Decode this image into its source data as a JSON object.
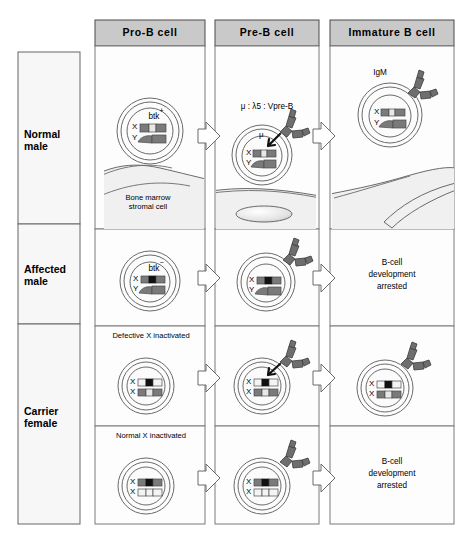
{
  "figure": {
    "background": "#ffffff",
    "header_fill": "#c9c9c9",
    "panel_fill": "#fdfdfd",
    "stroke": "#555555",
    "stromal_fill": "#f0f0f0",
    "receptor_fill": "#6e6e6e",
    "chr_gray": "#7a7a7a",
    "chr_light": "#e8e8e8",
    "chr_black": "#111111"
  },
  "columns": [
    {
      "id": "pro-b",
      "label": "Pro-B cell"
    },
    {
      "id": "pre-b",
      "label": "Pre-B cell"
    },
    {
      "id": "immature",
      "label": "Immature B cell"
    }
  ],
  "rows": [
    {
      "id": "normal-male",
      "label_line1": "Normal",
      "label_line2": "male"
    },
    {
      "id": "affected-male",
      "label_line1": "Affected",
      "label_line2": "male"
    },
    {
      "id": "carrier-female",
      "label_line1": "Carrier",
      "label_line2": "female"
    }
  ],
  "annotations": {
    "btk_positive": "btk",
    "btk_positive_sign": "+",
    "btk_negative": "btk",
    "btk_negative_sign": "−",
    "pre_b_receptor": "μ : λ5 : Vpre-B",
    "mu_chain": "μ",
    "igm": "IgM",
    "stromal_line1": "Bone  marrow",
    "stromal_line2": "stromal  cell",
    "defective_x_inactivated": "Defective  X  inactivated",
    "normal_x_inactivated": "Normal  X  inactivated",
    "arrested_line1": "B-cell",
    "arrested_line2": "development",
    "arrested_line3": "arrested"
  },
  "chromosome_labels": {
    "x": "X",
    "y": "Y"
  },
  "cells": [
    {
      "row": "normal-male",
      "column": "pro-b",
      "karyotype": "XY",
      "btk_state": "positive",
      "label": "btk",
      "has_receptor": false,
      "has_igm": false
    },
    {
      "row": "normal-male",
      "column": "pre-b",
      "karyotype": "XY",
      "btk_state": "positive",
      "label": "μ : λ5 : Vpre-B",
      "has_receptor": true,
      "has_igm": false
    },
    {
      "row": "normal-male",
      "column": "immature",
      "karyotype": "XY",
      "btk_state": "positive",
      "label": "IgM",
      "has_receptor": true,
      "has_igm": true
    },
    {
      "row": "affected-male",
      "column": "pro-b",
      "karyotype": "XY",
      "btk_state": "negative",
      "label": "btk",
      "has_receptor": false,
      "has_igm": false
    },
    {
      "row": "affected-male",
      "column": "pre-b",
      "karyotype": "XY",
      "btk_state": "negative",
      "label": "",
      "has_receptor": true,
      "has_igm": false
    },
    {
      "row": "affected-male",
      "column": "immature",
      "karyotype": "",
      "btk_state": "arrested",
      "label": "B-cell development arrested",
      "has_receptor": false,
      "has_igm": false
    },
    {
      "row": "carrier-female-top",
      "column": "pro-b",
      "karyotype": "XX",
      "btk_state": "defective-x-inactivated",
      "label": "Defective  X  inactivated",
      "has_receptor": false,
      "has_igm": false
    },
    {
      "row": "carrier-female-top",
      "column": "pre-b",
      "karyotype": "XX",
      "btk_state": "defective-x-inactivated",
      "label": "",
      "has_receptor": true,
      "has_igm": false
    },
    {
      "row": "carrier-female-top",
      "column": "immature",
      "karyotype": "XX",
      "btk_state": "defective-x-inactivated",
      "label": "",
      "has_receptor": true,
      "has_igm": true
    },
    {
      "row": "carrier-female-bottom",
      "column": "pro-b",
      "karyotype": "XX",
      "btk_state": "normal-x-inactivated",
      "label": "Normal  X  inactivated",
      "has_receptor": false,
      "has_igm": false
    },
    {
      "row": "carrier-female-bottom",
      "column": "pre-b",
      "karyotype": "XX",
      "btk_state": "normal-x-inactivated",
      "label": "",
      "has_receptor": true,
      "has_igm": false
    },
    {
      "row": "carrier-female-bottom",
      "column": "immature",
      "karyotype": "",
      "btk_state": "arrested",
      "label": "B-cell development arrested",
      "has_receptor": false,
      "has_igm": false
    }
  ]
}
